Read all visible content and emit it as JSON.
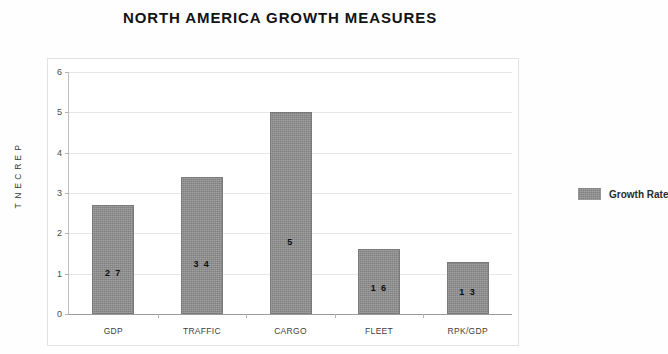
{
  "chart_data": {
    "type": "bar",
    "title": "NORTH AMERICA GROWTH MEASURES",
    "xlabel": "",
    "ylabel": "PERCENT",
    "categories": [
      "GDP",
      "TRAFFIC",
      "CARGO",
      "FLEET",
      "RPK/GDP"
    ],
    "values": [
      2.7,
      3.4,
      5.0,
      1.6,
      1.3
    ],
    "data_labels": [
      "2 7",
      "3 4",
      "5",
      "1 6",
      "1 3"
    ],
    "series": [
      {
        "name": "Growth Rate",
        "values": [
          2.7,
          3.4,
          5.0,
          1.6,
          1.3
        ],
        "color": "#8c8c8c"
      }
    ],
    "ylim": [
      0,
      6
    ],
    "y_ticks": [
      "0",
      "1",
      "2",
      "3",
      "4",
      "5",
      "6"
    ],
    "grid": true,
    "legend_position": "right"
  },
  "legend": {
    "entries": [
      {
        "label": "Growth Rate"
      }
    ]
  },
  "axis": {
    "y_title_letters": [
      "P",
      "E",
      "R",
      "C",
      "E",
      "N",
      "T"
    ]
  }
}
